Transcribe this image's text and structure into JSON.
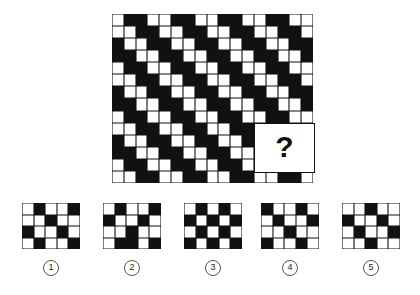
{
  "puzzle": {
    "type": "visual-pattern-matrix",
    "prompt_symbol": "?",
    "main_grid": {
      "columns": 17,
      "rows": 14,
      "colors": {
        "filled": "#111111",
        "empty": "#ffffff"
      },
      "missing_region": {
        "col_start": 12,
        "col_end": 16,
        "row_start": 9,
        "row_end": 12
      },
      "cells": [
        [
          0,
          1,
          1,
          0,
          0,
          1,
          1,
          0,
          0,
          1,
          1,
          0,
          0,
          1,
          1,
          0,
          0
        ],
        [
          0,
          0,
          1,
          1,
          0,
          0,
          1,
          1,
          0,
          0,
          1,
          1,
          0,
          0,
          1,
          1,
          0
        ],
        [
          1,
          0,
          0,
          1,
          1,
          0,
          0,
          1,
          1,
          0,
          0,
          1,
          1,
          0,
          0,
          1,
          1
        ],
        [
          1,
          1,
          0,
          0,
          1,
          1,
          0,
          0,
          1,
          1,
          0,
          0,
          1,
          1,
          0,
          0,
          1
        ],
        [
          0,
          1,
          1,
          0,
          0,
          1,
          1,
          0,
          0,
          1,
          1,
          0,
          0,
          1,
          1,
          0,
          0
        ],
        [
          0,
          0,
          1,
          1,
          0,
          0,
          1,
          1,
          0,
          0,
          1,
          1,
          0,
          0,
          1,
          1,
          0
        ],
        [
          1,
          0,
          0,
          1,
          1,
          0,
          0,
          1,
          1,
          0,
          0,
          1,
          1,
          0,
          0,
          1,
          1
        ],
        [
          1,
          1,
          0,
          0,
          1,
          1,
          0,
          0,
          1,
          1,
          0,
          0,
          1,
          1,
          0,
          0,
          1
        ],
        [
          0,
          1,
          1,
          0,
          0,
          1,
          1,
          0,
          0,
          1,
          1,
          0,
          0,
          1,
          1,
          0,
          0
        ],
        [
          0,
          0,
          1,
          1,
          0,
          0,
          1,
          1,
          0,
          0,
          1,
          1,
          0,
          0,
          1,
          1,
          0
        ],
        [
          1,
          0,
          0,
          1,
          1,
          0,
          0,
          1,
          1,
          0,
          0,
          1,
          1,
          0,
          0,
          1,
          1
        ],
        [
          1,
          1,
          0,
          0,
          1,
          1,
          0,
          0,
          1,
          1,
          0,
          0,
          1,
          1,
          0,
          0,
          1
        ],
        [
          0,
          1,
          1,
          0,
          0,
          1,
          1,
          0,
          0,
          1,
          1,
          0,
          0,
          1,
          1,
          0,
          0
        ],
        [
          0,
          0,
          1,
          1,
          0,
          0,
          1,
          1,
          0,
          0,
          1,
          1,
          0,
          0,
          1,
          1,
          0
        ]
      ]
    },
    "options": [
      {
        "number": "1",
        "columns": 5,
        "rows": 4,
        "cells": [
          [
            0,
            1,
            0,
            0,
            1
          ],
          [
            0,
            0,
            1,
            0,
            0
          ],
          [
            1,
            0,
            0,
            1,
            0
          ],
          [
            0,
            1,
            0,
            0,
            1
          ]
        ]
      },
      {
        "number": "2",
        "columns": 5,
        "rows": 4,
        "cells": [
          [
            0,
            1,
            0,
            0,
            1
          ],
          [
            1,
            0,
            0,
            1,
            0
          ],
          [
            0,
            0,
            1,
            0,
            0
          ],
          [
            0,
            1,
            1,
            0,
            1
          ]
        ]
      },
      {
        "number": "3",
        "columns": 5,
        "rows": 4,
        "cells": [
          [
            0,
            1,
            0,
            1,
            0
          ],
          [
            1,
            0,
            1,
            0,
            1
          ],
          [
            0,
            1,
            0,
            1,
            0
          ],
          [
            1,
            0,
            1,
            0,
            1
          ]
        ]
      },
      {
        "number": "4",
        "columns": 5,
        "rows": 4,
        "cells": [
          [
            1,
            0,
            0,
            1,
            0
          ],
          [
            0,
            1,
            0,
            0,
            1
          ],
          [
            0,
            0,
            1,
            0,
            0
          ],
          [
            1,
            0,
            0,
            1,
            0
          ]
        ]
      },
      {
        "number": "5",
        "columns": 5,
        "rows": 4,
        "cells": [
          [
            0,
            0,
            1,
            0,
            0
          ],
          [
            1,
            0,
            0,
            1,
            0
          ],
          [
            0,
            1,
            0,
            0,
            1
          ],
          [
            0,
            0,
            1,
            0,
            0
          ]
        ]
      }
    ]
  }
}
